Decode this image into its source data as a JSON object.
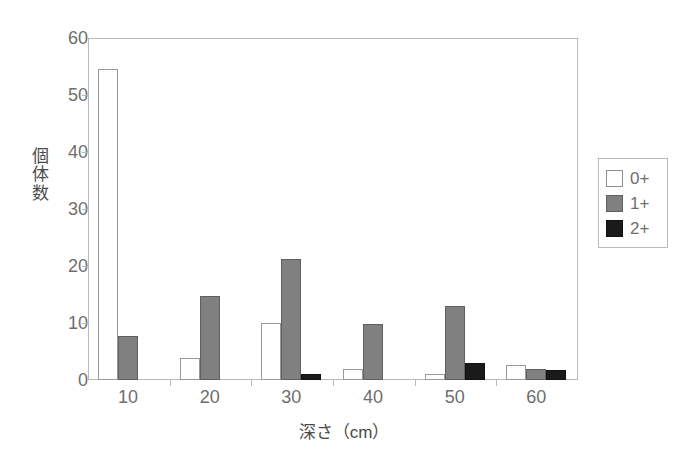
{
  "chart_data": {
    "type": "bar",
    "title": "",
    "xlabel": "深さ（cm）",
    "ylabel": "個体数",
    "categories": [
      "10",
      "20",
      "30",
      "40",
      "50",
      "60"
    ],
    "series": [
      {
        "name": "0+",
        "color": "#ffffff",
        "values": [
          54.5,
          3.8,
          10.0,
          2.0,
          1.0,
          2.7
        ]
      },
      {
        "name": "1+",
        "color": "#808080",
        "values": [
          7.8,
          14.8,
          21.2,
          9.9,
          13.0,
          2.0
        ]
      },
      {
        "name": "2+",
        "color": "#1a1a1a",
        "values": [
          0,
          0,
          1.0,
          0,
          3.0,
          1.7
        ]
      }
    ],
    "ylim": [
      0,
      60
    ],
    "yticks": [
      0,
      10,
      20,
      30,
      40,
      50,
      60
    ],
    "ytick_labels": [
      "0",
      "10",
      "20",
      "30",
      "40",
      "50",
      "60"
    ],
    "xtick_labels": [
      "10",
      "20",
      "30",
      "40",
      "50",
      "60"
    ],
    "grid": false,
    "legend_position": "right-outside",
    "legend_entries": [
      "0+",
      "1+",
      "2+"
    ]
  },
  "axes": {
    "y_title_chars": [
      "個",
      "体",
      "数"
    ]
  }
}
